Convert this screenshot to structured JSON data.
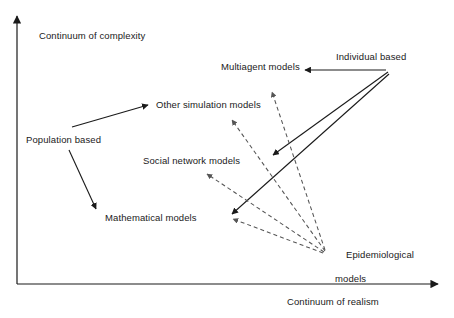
{
  "figure": {
    "type": "conceptual-quadrant-diagram",
    "background_color": "#ffffff",
    "line_color": "#1a1a1a",
    "dashed_line_color": "#555555"
  },
  "axes": {
    "y": {
      "label": "Continuum of complexity",
      "direction": "up",
      "origin": [
        17,
        284
      ],
      "end": [
        17,
        15
      ]
    },
    "x": {
      "label": "Continuum of realism",
      "direction": "right",
      "origin": [
        17,
        284
      ],
      "end": [
        440,
        284
      ]
    }
  },
  "nodes": [
    {
      "id": "population",
      "label": "Population based",
      "x": 26,
      "y": 134,
      "kind": "paradigm"
    },
    {
      "id": "individual",
      "label": "Individual based",
      "x": 336,
      "y": 51,
      "kind": "paradigm"
    },
    {
      "id": "epidemiological",
      "label": "Epidemiological",
      "label2": "models",
      "x": 335,
      "y": 237,
      "kind": "paradigm"
    },
    {
      "id": "mathematical",
      "label": "Mathematical models",
      "x": 105,
      "y": 212,
      "kind": "model"
    },
    {
      "id": "othersim",
      "label": "Other simulation models",
      "x": 156,
      "y": 99,
      "kind": "model"
    },
    {
      "id": "social",
      "label": "Social network models",
      "x": 143,
      "y": 155,
      "kind": "model"
    },
    {
      "id": "multiagent",
      "label": "Multiagent models",
      "x": 221,
      "y": 61,
      "kind": "model"
    }
  ],
  "edges": [
    {
      "id": "pop-to-othersim",
      "from": "population",
      "to": "othersim",
      "style": "solid",
      "x1": 72,
      "y1": 127,
      "x2": 150,
      "y2": 104
    },
    {
      "id": "pop-to-math",
      "from": "population",
      "to": "mathematical",
      "style": "solid",
      "x1": 69,
      "y1": 150,
      "x2": 96,
      "y2": 211
    },
    {
      "id": "ind-to-multi",
      "from": "individual",
      "to": "multiagent",
      "style": "solid",
      "x1": 386,
      "y1": 70,
      "x2": 303,
      "y2": 70
    },
    {
      "id": "ind-to-social",
      "from": "individual",
      "to": "social",
      "style": "solid",
      "x1": 388,
      "y1": 72,
      "x2": 271,
      "y2": 156
    },
    {
      "id": "ind-to-math",
      "from": "individual",
      "to": "mathematical",
      "style": "solid",
      "x1": 389,
      "y1": 74,
      "x2": 230,
      "y2": 215
    },
    {
      "id": "epi-to-multi",
      "from": "epidemiological",
      "to": "multiagent",
      "style": "dashed",
      "x1": 325,
      "y1": 250,
      "x2": 271,
      "y2": 90
    },
    {
      "id": "epi-to-othersim",
      "from": "epidemiological",
      "to": "othersim",
      "style": "dashed",
      "x1": 325,
      "y1": 251,
      "x2": 230,
      "y2": 118
    },
    {
      "id": "epi-to-social",
      "from": "epidemiological",
      "to": "social",
      "style": "dashed",
      "x1": 324,
      "y1": 252,
      "x2": 205,
      "y2": 175
    },
    {
      "id": "epi-to-math",
      "from": "epidemiological",
      "to": "mathematical",
      "style": "dashed",
      "x1": 323,
      "y1": 253,
      "x2": 231,
      "y2": 219
    }
  ]
}
